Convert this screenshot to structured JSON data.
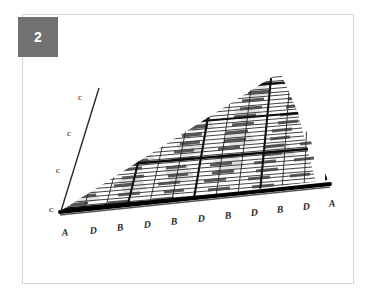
{
  "figure": {
    "panel_number": "2",
    "caption": "",
    "background_color": "#ffffff",
    "panel_border_color": "#d6d6d6",
    "badge_color": "#717171",
    "badge_text_color": "#ffffff"
  },
  "diagram": {
    "type": "3d-perspective-lattice-grid",
    "mesh_line_color": "#1a1a1a",
    "slat_fill_color": "#ffffff",
    "slat_edge_color": "#3a3a3a",
    "patch_fill_color": "#e2e2e2",
    "thick_rail_color": "#000000",
    "columns": 11,
    "rows": 8,
    "thick_row_indices": [
      0,
      3,
      5,
      7
    ],
    "thick_col_indices": [
      0,
      3,
      6,
      9
    ]
  },
  "axes": {
    "bottom": {
      "name": "bottom-edge-axis",
      "labels": [
        "A",
        "D",
        "B",
        "D",
        "B",
        "D",
        "B",
        "D",
        "B",
        "D",
        "A"
      ]
    },
    "bottom_corner": {
      "name": "bottom-left-corner-label",
      "label": "C"
    },
    "left": {
      "name": "left-edge-axis",
      "labels": [
        "C",
        "C",
        "C"
      ]
    }
  }
}
